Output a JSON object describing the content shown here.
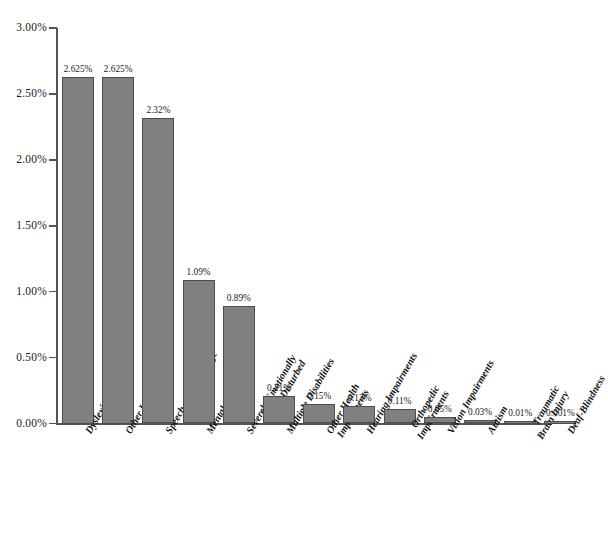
{
  "chart_data": {
    "type": "bar",
    "title": "",
    "subtitle": "",
    "xlabel": "",
    "ylabel": "",
    "ylim": [
      0,
      3.0
    ],
    "y_tick_labels": [
      "3.00%",
      "2.50%",
      "2.00%",
      "1.50%",
      "1.00%",
      "0.50%",
      "0.00%"
    ],
    "y_tick_values": [
      3.0,
      2.5,
      2.0,
      1.5,
      1.0,
      0.5,
      0.0
    ],
    "grid": false,
    "legend": null,
    "bar_color": "#808080",
    "bar_border_color": "#4d4d4d",
    "axis_color": "#555555",
    "background_color": "#ffffff",
    "categories": [
      "Dyslexic",
      "Other LD",
      "Speech and Language",
      "Mental Retardation",
      "Severely Emotionally Disturbed",
      "Multiple Disabilities",
      "Other Health Impairments",
      "Hearing Impairments",
      "Orthopedic Impairments",
      "Vision Impairments",
      "Autism",
      "Traumatic Brain Injury",
      "Deaf-Blindness"
    ],
    "category_lines": [
      [
        "Dyslexic"
      ],
      [
        "Other LD"
      ],
      [
        "Speech and Language"
      ],
      [
        "Mental Retardation"
      ],
      [
        "Severely Emotionally",
        "Disturbed"
      ],
      [
        "Multiple Disabilities"
      ],
      [
        "Other Health",
        "Impairments"
      ],
      [
        "Hearing Impairments"
      ],
      [
        "Orthopedic",
        "Impairments"
      ],
      [
        "Vision Impairments"
      ],
      [
        "Autism"
      ],
      [
        "Traumatic",
        "Brain Injury"
      ],
      [
        "Deaf-Blindness"
      ]
    ],
    "values": [
      2.625,
      2.625,
      2.32,
      1.09,
      0.89,
      0.21,
      0.15,
      0.13,
      0.11,
      0.05,
      0.03,
      0.01,
      0.001
    ],
    "value_labels": [
      "2.625%",
      "2.625%",
      "2.32%",
      "1.09%",
      "0.89%",
      "0.21%",
      "0.15%",
      "0.13%",
      "0.11%",
      "0.05%",
      "0.03%",
      "0.01%",
      "0.001%"
    ]
  }
}
